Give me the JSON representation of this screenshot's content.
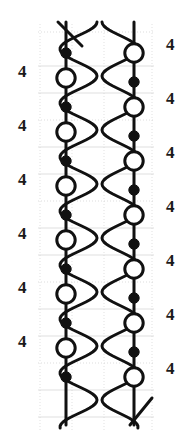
{
  "diagram": {
    "width": 190,
    "height": 445,
    "background_color": "#ffffff",
    "stroke_color": "#111111",
    "grid_color": "#cfcfcf",
    "node_fill_open": "#ffffff",
    "node_fill_solid": "#111111",
    "columns": [
      {
        "name": "left-braid",
        "chain_x": 66,
        "wave_x_min": 66,
        "wave_x_max": 97,
        "nodes": [
          {
            "y": 53,
            "type": "solid"
          },
          {
            "y": 78,
            "type": "open"
          },
          {
            "y": 107,
            "type": "solid"
          },
          {
            "y": 132,
            "type": "open"
          },
          {
            "y": 161,
            "type": "solid"
          },
          {
            "y": 186,
            "type": "open"
          },
          {
            "y": 215,
            "type": "solid"
          },
          {
            "y": 240,
            "type": "open"
          },
          {
            "y": 269,
            "type": "solid"
          },
          {
            "y": 294,
            "type": "open"
          },
          {
            "y": 323,
            "type": "solid"
          },
          {
            "y": 348,
            "type": "open"
          },
          {
            "y": 377,
            "type": "solid"
          }
        ]
      },
      {
        "name": "right-braid",
        "chain_x": 134,
        "wave_x_min": 104,
        "wave_x_max": 134,
        "nodes": [
          {
            "y": 53,
            "type": "open"
          },
          {
            "y": 82,
            "type": "solid"
          },
          {
            "y": 107,
            "type": "open"
          },
          {
            "y": 136,
            "type": "solid"
          },
          {
            "y": 161,
            "type": "open"
          },
          {
            "y": 190,
            "type": "solid"
          },
          {
            "y": 215,
            "type": "open"
          },
          {
            "y": 244,
            "type": "solid"
          },
          {
            "y": 269,
            "type": "open"
          },
          {
            "y": 298,
            "type": "solid"
          },
          {
            "y": 323,
            "type": "open"
          },
          {
            "y": 352,
            "type": "solid"
          },
          {
            "y": 377,
            "type": "open"
          }
        ]
      }
    ],
    "grid": {
      "vertical_lines_x": [
        40,
        72,
        104,
        152
      ],
      "horizontal_lines_y": [
        32,
        66,
        93,
        120,
        147,
        174,
        201,
        228,
        255,
        282,
        309,
        336,
        363,
        390,
        417
      ],
      "dotted_rows_y": [
        32,
        120,
        201,
        282,
        363
      ]
    }
  },
  "labels": {
    "left": [
      {
        "text": "4",
        "y": 72
      },
      {
        "text": "4",
        "y": 126
      },
      {
        "text": "4",
        "y": 180
      },
      {
        "text": "4",
        "y": 234
      },
      {
        "text": "4",
        "y": 288
      },
      {
        "text": "4",
        "y": 342
      }
    ],
    "right": [
      {
        "text": "4",
        "y": 45
      },
      {
        "text": "4",
        "y": 99
      },
      {
        "text": "4",
        "y": 153
      },
      {
        "text": "4",
        "y": 207
      },
      {
        "text": "4",
        "y": 261
      },
      {
        "text": "4",
        "y": 315
      },
      {
        "text": "4",
        "y": 369
      }
    ]
  },
  "chart_data": {
    "type": "diagram",
    "xlabel": "",
    "ylabel": "",
    "series": [
      {
        "name": "left-chain",
        "values": [
          "solid",
          "open",
          "solid",
          "open",
          "solid",
          "open",
          "solid",
          "open",
          "solid",
          "open",
          "solid",
          "open",
          "solid"
        ]
      },
      {
        "name": "right-chain",
        "values": [
          "open",
          "solid",
          "open",
          "solid",
          "open",
          "solid",
          "open",
          "solid",
          "open",
          "solid",
          "open",
          "solid",
          "open"
        ]
      }
    ],
    "annotations_left": [
      "4",
      "4",
      "4",
      "4",
      "4",
      "4"
    ],
    "annotations_right": [
      "4",
      "4",
      "4",
      "4",
      "4",
      "4",
      "4"
    ]
  }
}
